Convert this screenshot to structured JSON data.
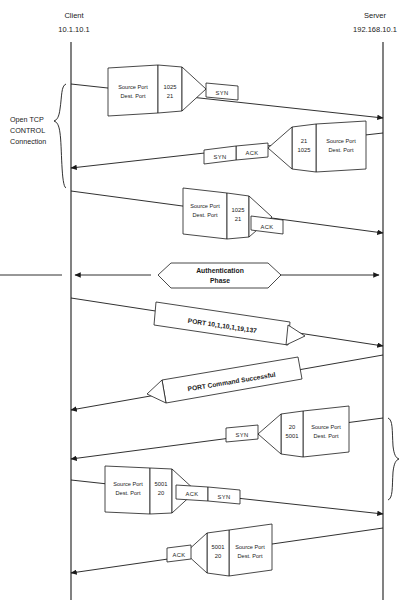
{
  "diagram": {
    "endpoints": {
      "client": {
        "name": "Client",
        "ip": "10.1.10.1"
      },
      "server": {
        "name": "Server",
        "ip": "192.168.10.1"
      }
    },
    "annotations": {
      "control": {
        "line1": "Open TCP",
        "line2": "CONTROL",
        "line3": "Connection"
      }
    },
    "field_labels": {
      "source": "Source Port",
      "dest": "Dest.  Port"
    },
    "messages": [
      {
        "id": "syn-1",
        "direction": "client-to-server",
        "source_port": "1025",
        "dest_port": "21",
        "flags": [
          "SYN"
        ]
      },
      {
        "id": "synack-1",
        "direction": "server-to-client",
        "source_port": "21",
        "dest_port": "1025",
        "flags": [
          "SYN",
          "ACK"
        ]
      },
      {
        "id": "ack-1",
        "direction": "client-to-server",
        "source_port": "1025",
        "dest_port": "21",
        "flags": [
          "ACK"
        ]
      },
      {
        "id": "auth-phase",
        "direction": "bidirectional",
        "label": "Authentication Phase",
        "line1": "Authentication",
        "line2": "Phase"
      },
      {
        "id": "port-cmd",
        "direction": "client-to-server",
        "label": "PORT 10,1,10,1,19,137"
      },
      {
        "id": "port-reply",
        "direction": "server-to-client",
        "label": "PORT  Command Successful"
      },
      {
        "id": "syn-2",
        "direction": "server-to-client",
        "source_port": "20",
        "dest_port": "5001",
        "flags": [
          "SYN"
        ]
      },
      {
        "id": "synack-2",
        "direction": "client-to-server",
        "source_port": "5001",
        "dest_port": "20",
        "flags": [
          "ACK",
          "SYN"
        ]
      },
      {
        "id": "ack-2",
        "direction": "server-to-client",
        "source_port": "5001",
        "dest_port": "20",
        "flags": [
          "ACK"
        ]
      }
    ],
    "colors": {
      "stroke": "#1a1a1a",
      "fill": "#ffffff",
      "background": "#ffffff"
    }
  }
}
